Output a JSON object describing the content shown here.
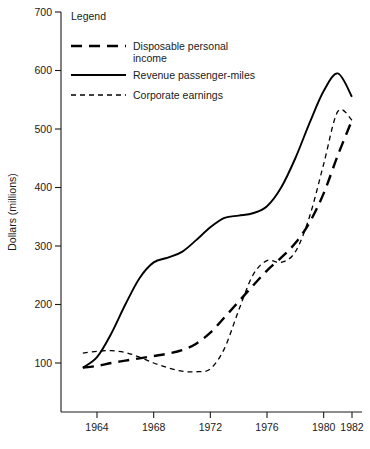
{
  "chart_data": {
    "type": "line",
    "title": "",
    "xlabel": "",
    "ylabel": "Dollars (millions)",
    "xlim": [
      1962.5,
      1982.5
    ],
    "ylim": [
      0,
      700
    ],
    "grid": false,
    "y_ticks": [
      100,
      200,
      300,
      400,
      500,
      600,
      700
    ],
    "y_tick_labels": [
      "100",
      "200",
      "300",
      "400",
      "500",
      "600",
      "700"
    ],
    "x_ticks": [
      1964,
      1968,
      1972,
      1976,
      1980,
      1982
    ],
    "x_tick_labels": [
      "1964",
      "1968",
      "1972",
      "1976",
      "1980",
      "1982"
    ],
    "legend": {
      "title": "Legend",
      "position": "upper-left-inside",
      "entries": [
        {
          "name": "Disposable personal income",
          "style": "long-dash"
        },
        {
          "name": "Revenue passenger-miles",
          "style": "solid"
        },
        {
          "name": "Corporate earnings",
          "style": "short-dash"
        }
      ]
    },
    "x": [
      1963,
      1964,
      1965,
      1966,
      1967,
      1968,
      1969,
      1970,
      1971,
      1972,
      1973,
      1974,
      1975,
      1976,
      1977,
      1978,
      1979,
      1980,
      1981,
      1982
    ],
    "series": [
      {
        "name": "Disposable personal income",
        "style": "long-dash",
        "values": [
          92,
          95,
          100,
          104,
          108,
          112,
          116,
          122,
          133,
          152,
          178,
          205,
          232,
          258,
          280,
          305,
          340,
          390,
          455,
          515
        ]
      },
      {
        "name": "Revenue passenger-miles",
        "style": "solid",
        "values": [
          92,
          110,
          150,
          200,
          245,
          272,
          280,
          290,
          310,
          332,
          348,
          352,
          356,
          368,
          400,
          450,
          510,
          565,
          595,
          555
        ]
      },
      {
        "name": "Corporate earnings",
        "style": "short-dash",
        "values": [
          117,
          120,
          121,
          118,
          110,
          100,
          92,
          86,
          85,
          90,
          125,
          190,
          250,
          275,
          272,
          290,
          350,
          440,
          530,
          515
        ]
      }
    ]
  }
}
